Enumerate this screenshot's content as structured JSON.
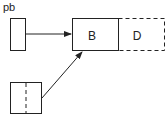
{
  "diagram": {
    "label_pb": "pb",
    "box_b_label": "B",
    "box_d_label": "D",
    "stroke_color": "#222222",
    "background": "#ffffff"
  }
}
